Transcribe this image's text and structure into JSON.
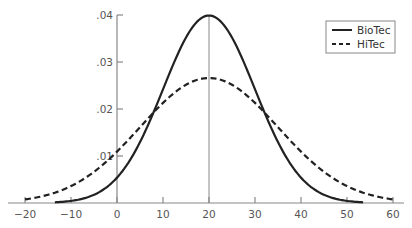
{
  "chart_data": {
    "type": "line",
    "title": "",
    "xlabel": "",
    "ylabel": "",
    "xlim": [
      -22,
      64
    ],
    "ylim": [
      0,
      0.04
    ],
    "x_ticks": [
      -20,
      -10,
      0,
      10,
      20,
      30,
      40,
      50,
      60
    ],
    "x_tick_labels": [
      "−20",
      "−10",
      "0",
      "10",
      "20",
      "30",
      "40",
      "50",
      "60"
    ],
    "y_ticks": [
      0.01,
      0.02,
      0.03,
      0.04
    ],
    "y_tick_labels": [
      ".01",
      ".02",
      ".03",
      ".04"
    ],
    "grid": false,
    "reference_lines": [
      {
        "x": 20,
        "label": "mean"
      }
    ],
    "legend_position": "upper right",
    "series": [
      {
        "name": "BioTec",
        "style": "solid",
        "distribution": "normal",
        "mean": 20,
        "std": 10,
        "x_range": [
          -13.5,
          53.5
        ],
        "x": [
          -10,
          0,
          8,
          10,
          20,
          30,
          32,
          40,
          50
        ],
        "values": [
          0.0018,
          0.0054,
          0.0194,
          0.0242,
          0.0399,
          0.0242,
          0.0194,
          0.0054,
          0.0018
        ]
      },
      {
        "name": "HiTec",
        "style": "dashed",
        "distribution": "normal",
        "mean": 20,
        "std": 15,
        "x_range": [
          -20,
          60
        ],
        "x": [
          -20,
          -10,
          0,
          8,
          10,
          20,
          30,
          32,
          40,
          50,
          60
        ],
        "values": [
          0.0007,
          0.0036,
          0.0109,
          0.0193,
          0.0213,
          0.0266,
          0.0213,
          0.0193,
          0.0109,
          0.0036,
          0.0007
        ]
      }
    ],
    "colors": {
      "axis": "#888888",
      "curve": "#222222",
      "text": "#555555"
    }
  },
  "legend": {
    "items": [
      {
        "label": "BioTec",
        "style": "solid"
      },
      {
        "label": "HiTec",
        "style": "dashed"
      }
    ]
  }
}
